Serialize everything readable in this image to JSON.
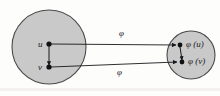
{
  "figure": {
    "name": "graph-homomorphism-diagram",
    "background_color": "#fdfdfc",
    "ink_color": "#16181a",
    "disk_fill": "#c9c9c9",
    "disk_stroke": "#4a4a4a"
  },
  "domain_disk": {
    "label": "",
    "cx": 49,
    "cy": 47,
    "r": 37
  },
  "codomain_disk": {
    "label": "",
    "cx": 191,
    "cy": 55,
    "r": 24
  },
  "nodes": [
    {
      "id": "u",
      "label": "u",
      "cx": 49,
      "cy": 44
    },
    {
      "id": "v",
      "label": "v",
      "cx": 49,
      "cy": 67
    },
    {
      "id": "phi_u",
      "label": "φ (u)",
      "cx": 180,
      "cy": 45
    },
    {
      "id": "phi_v",
      "label": "φ (v)",
      "cx": 182,
      "cy": 62
    }
  ],
  "node_labels": {
    "u": "u",
    "v": "v",
    "phi_u": "φ (u)",
    "phi_v": "φ (v)"
  },
  "edges": [
    {
      "id": "uv-edge",
      "from": "u",
      "to": "v",
      "style": "arrow"
    },
    {
      "id": "phi-uv-edge",
      "from": "phi_u",
      "to": "phi_v",
      "style": "arrow"
    }
  ],
  "map_arrows": [
    {
      "id": "map-arrow-upper",
      "label": "φ",
      "label_x": 120,
      "label_y": 33
    },
    {
      "id": "map-arrow-lower",
      "label": "φ",
      "label_x": 118,
      "label_y": 72
    }
  ],
  "map_labels": {
    "upper": "φ",
    "lower": "φ"
  }
}
